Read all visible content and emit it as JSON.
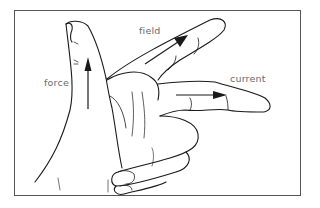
{
  "diagram": {
    "labels": {
      "thumb": "force",
      "first_finger": "field",
      "second_finger": "current"
    },
    "arrows": [
      {
        "name": "force-arrow",
        "direction": "up",
        "finger": "thumb"
      },
      {
        "name": "field-arrow",
        "direction": "up-right",
        "finger": "first_finger"
      },
      {
        "name": "current-arrow",
        "direction": "right",
        "finger": "second_finger"
      }
    ],
    "colors": {
      "line": "#1a1a1a",
      "label_text": "#6a6a6a",
      "frame": "#555555",
      "background": "#ffffff"
    }
  }
}
